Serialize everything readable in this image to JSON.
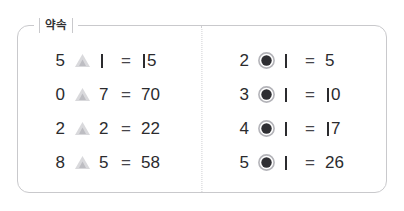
{
  "panel": {
    "legend": "약속",
    "border_color": "#c9c9cc",
    "divider_color": "#cfcfd2",
    "background": "#ffffff"
  },
  "icons": {
    "triangle": {
      "name": "triangle-operator-icon",
      "color": "#d9d9dc",
      "inner_color": "#bdbdc2"
    },
    "bullseye": {
      "name": "bullseye-operator-icon",
      "ring_color": "#b4b4b9",
      "fill_color": "#2f2f33"
    }
  },
  "columns": [
    {
      "id": "left-column",
      "operator": "triangle",
      "rows": [
        {
          "left": "5",
          "right": "1",
          "equals": "=",
          "result": "15"
        },
        {
          "left": "0",
          "right": "7",
          "equals": "=",
          "result": "70"
        },
        {
          "left": "2",
          "right": "2",
          "equals": "=",
          "result": "22"
        },
        {
          "left": "8",
          "right": "5",
          "equals": "=",
          "result": "58"
        }
      ]
    },
    {
      "id": "right-column",
      "operator": "bullseye",
      "rows": [
        {
          "left": "2",
          "right": "1",
          "equals": "=",
          "result": "5"
        },
        {
          "left": "3",
          "right": "1",
          "equals": "=",
          "result": "10"
        },
        {
          "left": "4",
          "right": "1",
          "equals": "=",
          "result": "17"
        },
        {
          "left": "5",
          "right": "1",
          "equals": "=",
          "result": "26"
        }
      ]
    }
  ]
}
